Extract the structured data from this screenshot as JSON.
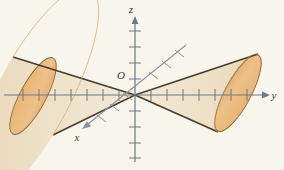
{
  "figure": {
    "background_color": "#f7f5ec",
    "labels": {
      "x_axis": "x",
      "y_axis": "y",
      "z_axis": "z",
      "origin": "O"
    },
    "colors": {
      "background": "#f7f5ec",
      "axis": "#7a8490",
      "axis_dark": "#6e7884",
      "cone_outline": "#4a3b2a",
      "cone_body_fill": "#efe3cb",
      "cone_cap_fill": "#e9bd83",
      "cone_cap_outline": "#8a6434",
      "label_text": "#3b3b3b"
    },
    "axes": {
      "origin_px": [
        135,
        95
      ],
      "z": {
        "direction": "up",
        "arrow_tip_px": [
          135,
          18
        ],
        "negative_end_px": [
          135,
          162
        ],
        "tick_count_positive": 5,
        "tick_count_negative": 4,
        "tick_spacing_px": 16
      },
      "y": {
        "direction": "right",
        "arrow_tip_px": [
          268,
          95
        ],
        "negative_end_px": [
          4,
          95
        ],
        "tick_count_positive": 7,
        "tick_count_negative": 7,
        "tick_spacing_px": 16
      },
      "x": {
        "direction": "lower-left",
        "arrow_tip_px": [
          82,
          128
        ],
        "negative_end_px": [
          186,
          45
        ],
        "tick_count": 6,
        "tick_spacing_px": 17
      }
    },
    "cones": {
      "description": "Two nappes of an elliptic cone meeting at the origin, opening along the positive and negative y directions",
      "nappe_right": {
        "apex_px": [
          135,
          95
        ],
        "cap_center_px": [
          238,
          93
        ],
        "cap_rx": 13,
        "cap_ry": 43,
        "cap_rotation_deg": 28
      },
      "nappe_left": {
        "apex_px": [
          135,
          95
        ],
        "cap_center_px": [
          33,
          96
        ],
        "cap_rx": 13,
        "cap_ry": 43,
        "cap_rotation_deg": 28
      }
    }
  }
}
